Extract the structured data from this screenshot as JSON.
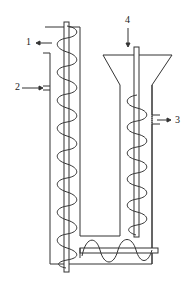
{
  "diagram": {
    "type": "screw conveyor apparatus schematic",
    "labels": [
      {
        "id": "1",
        "text": "1",
        "arrow": "outlet, pointing left from top of left column"
      },
      {
        "id": "2",
        "text": "2",
        "arrow": "inlet, pointing right into left column"
      },
      {
        "id": "3",
        "text": "3",
        "arrow": "outlet, pointing right from right column"
      },
      {
        "id": "4",
        "text": "4",
        "arrow": "feed, pointing down into hopper"
      }
    ],
    "components": [
      "left vertical screw",
      "right vertical screw with hopper",
      "bottom horizontal screw",
      "U-shaped casing"
    ],
    "stroke_color": "#333333",
    "background": "#ffffff"
  }
}
